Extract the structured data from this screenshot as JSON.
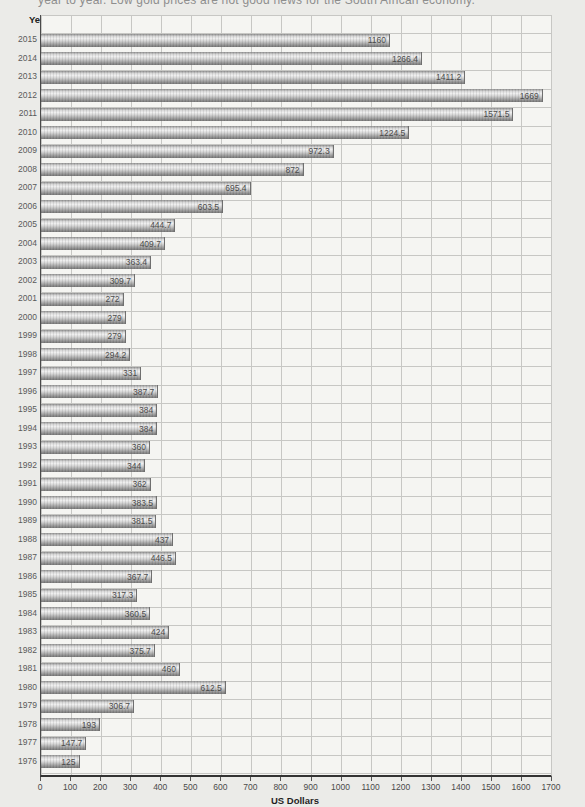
{
  "caption": "year to year. Low gold prices are not good news for the South African economy.",
  "colors": {
    "background": "#ebebe8",
    "plot_background": "#f5f5f2",
    "gridline": "#c7c7c4",
    "bar_base": "#b0b0b0",
    "axis": "#333333"
  },
  "chart_data": {
    "type": "bar",
    "orientation": "horizontal",
    "title": "",
    "xlabel": "US Dollars",
    "ylabel": "Year",
    "xlim": [
      0,
      1700
    ],
    "xtick_step": 100,
    "grid": true,
    "legend": false,
    "categories": [
      "2015",
      "2014",
      "2013",
      "2012",
      "2011",
      "2010",
      "2009",
      "2008",
      "2007",
      "2006",
      "2005",
      "2004",
      "2003",
      "2002",
      "2001",
      "2000",
      "1999",
      "1998",
      "1997",
      "1996",
      "1995",
      "1994",
      "1993",
      "1992",
      "1991",
      "1990",
      "1989",
      "1988",
      "1987",
      "1986",
      "1985",
      "1984",
      "1983",
      "1982",
      "1981",
      "1980",
      "1979",
      "1978",
      "1977",
      "1976"
    ],
    "values": [
      1160,
      1266.4,
      1411.2,
      1669,
      1571.5,
      1224.5,
      972.3,
      872,
      695.4,
      603.5,
      444.7,
      409.7,
      363.4,
      309.7,
      272,
      279,
      279,
      294.2,
      331,
      387.7,
      384,
      384,
      360,
      344,
      362,
      383.5,
      381.5,
      437,
      446.5,
      367.7,
      317.3,
      360.5,
      424,
      375.7,
      460,
      612.5,
      306.7,
      193,
      147.7,
      125
    ]
  }
}
